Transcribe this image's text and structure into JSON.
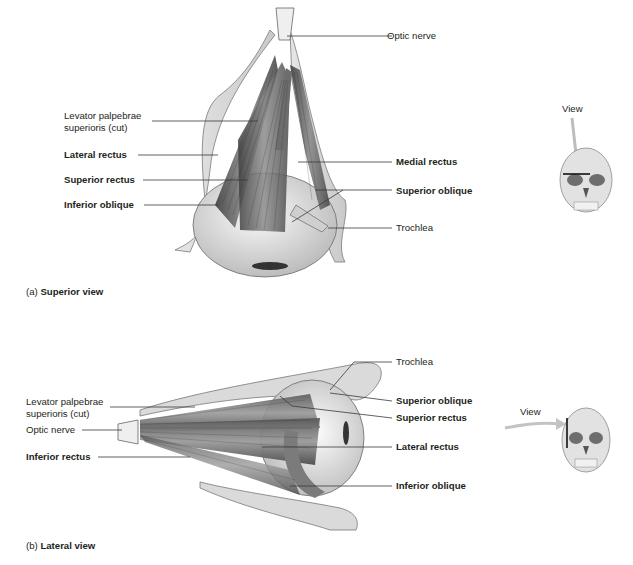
{
  "figure": {
    "panels": [
      {
        "id": "a",
        "caption_prefix": "(a)",
        "caption_title": "Superior view",
        "labels_left": [
          {
            "text_line1": "Levator palpebrae",
            "text_line2": "superioris (cut)",
            "bold": false
          },
          {
            "text": "Lateral rectus",
            "bold": true
          },
          {
            "text": "Superior rectus",
            "bold": true
          },
          {
            "text": "Inferior oblique",
            "bold": true
          }
        ],
        "labels_right": [
          {
            "text": "Optic nerve",
            "bold": false
          },
          {
            "text": "Medial rectus",
            "bold": true
          },
          {
            "text": "Superior oblique",
            "bold": true
          },
          {
            "text": "Trochlea",
            "bold": false
          }
        ],
        "orientation_icon": {
          "label": "View",
          "icon": "skull-superior-view-icon"
        }
      },
      {
        "id": "b",
        "caption_prefix": "(b)",
        "caption_title": "Lateral view",
        "labels_left": [
          {
            "text_line1": "Levator palpebrae",
            "text_line2": "superioris (cut)",
            "bold": false
          },
          {
            "text": "Optic nerve",
            "bold": false
          },
          {
            "text": "Inferior rectus",
            "bold": true
          }
        ],
        "labels_right": [
          {
            "text": "Trochlea",
            "bold": false
          },
          {
            "text": "Superior oblique",
            "bold": true
          },
          {
            "text": "Superior rectus",
            "bold": true
          },
          {
            "text": "Lateral rectus",
            "bold": true
          },
          {
            "text": "Inferior oblique",
            "bold": true
          }
        ],
        "orientation_icon": {
          "label": "View",
          "icon": "skull-lateral-view-icon"
        }
      }
    ],
    "colors": {
      "line": "#3a3a3a",
      "muscle_dark": "#5a5a5a",
      "muscle_mid": "#8a8a8a",
      "bone": "#d9d9d9",
      "eyeball": "#ececec",
      "arrow": "#b8b8b8"
    }
  }
}
